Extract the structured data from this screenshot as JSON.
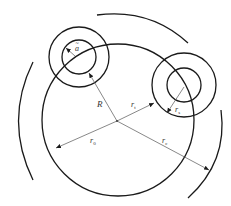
{
  "diagram": {
    "type": "geometric-schematic",
    "colors": {
      "stroke": "#1a1a1a",
      "dimension": "#555555",
      "label": "#333333",
      "background": "#ffffff"
    },
    "main_circle": {
      "cx": 118,
      "cy": 120,
      "r": 76
    },
    "center_point": {
      "x": 117,
      "y": 121
    },
    "small_circles": [
      {
        "name": "top-left",
        "cx": 79,
        "cy": 57,
        "r_outer": 30,
        "r_inner": 17
      },
      {
        "name": "right",
        "cx": 184,
        "cy": 85,
        "r_outer": 32,
        "r_inner": 17
      }
    ],
    "outer_arcs": [
      {
        "name": "left",
        "from": [
          33,
          62
        ],
        "to": [
          33,
          180
        ]
      },
      {
        "name": "top",
        "from": [
          97,
          15
        ],
        "to": [
          188,
          43
        ]
      },
      {
        "name": "right",
        "from": [
          221,
          110
        ],
        "to": [
          188,
          198
        ]
      }
    ],
    "labels": {
      "a": {
        "base": "a",
        "accent": "~",
        "x": 75,
        "y": 51
      },
      "R": {
        "text": "R",
        "x": 97,
        "y": 107
      },
      "r_t": {
        "base": "r",
        "sub": "t",
        "x": 131,
        "y": 107
      },
      "r_s": {
        "base": "r",
        "sub": "s",
        "x": 175,
        "y": 112
      },
      "r_0": {
        "base": "r",
        "sub": "0",
        "x": 90,
        "y": 143
      },
      "r_c": {
        "base": "r",
        "sub": "c",
        "x": 162,
        "y": 143
      }
    }
  }
}
